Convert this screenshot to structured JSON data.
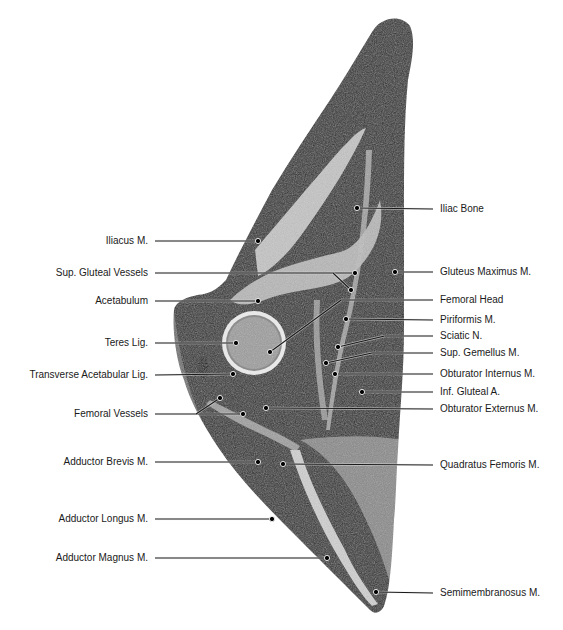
{
  "figure": {
    "background_color": "#ffffff",
    "tissue_dark": "#2e2e2e",
    "tissue_light": "#d8d8d8",
    "label_color": "#1a1a1a"
  },
  "labels_left": [
    {
      "text": "Iliacus M.",
      "y": 241,
      "line_x1": 155,
      "dots": [
        [
          258,
          241
        ]
      ]
    },
    {
      "text": "Sup. Gluteal Vessels",
      "y": 273,
      "line_x1": 155,
      "dots": [
        [
          355,
          273
        ],
        [
          351,
          290
        ]
      ]
    },
    {
      "text": "Acetabulum",
      "y": 301,
      "line_x1": 155,
      "dots": [
        [
          258,
          301
        ]
      ]
    },
    {
      "text": "Teres Lig.",
      "y": 343,
      "line_x1": 155,
      "dots": [
        [
          236,
          343
        ]
      ]
    },
    {
      "text": "Transverse Acetabular Lig.",
      "y": 375,
      "line_x1": 155,
      "dots": [
        [
          233,
          374
        ]
      ]
    },
    {
      "text": "Femoral Vessels",
      "y": 414,
      "line_x1": 155,
      "dots": [
        [
          220,
          398
        ],
        [
          243,
          414
        ]
      ]
    },
    {
      "text": "Adductor Brevis M.",
      "y": 462,
      "line_x1": 155,
      "dots": [
        [
          258,
          462
        ]
      ]
    },
    {
      "text": "Adductor Longus M.",
      "y": 519,
      "line_x1": 155,
      "dots": [
        [
          272,
          519
        ]
      ]
    },
    {
      "text": "Adductor Magnus M.",
      "y": 558,
      "line_x1": 155,
      "dots": [
        [
          327,
          558
        ]
      ]
    }
  ],
  "labels_right": [
    {
      "text": "Iliac Bone",
      "y": 209,
      "line_x2": 433,
      "dots": [
        [
          357,
          208
        ]
      ]
    },
    {
      "text": "Gluteus Maximus M.",
      "y": 272,
      "line_x2": 433,
      "dots": [
        [
          395,
          272
        ]
      ]
    },
    {
      "text": "Femoral Head",
      "y": 300,
      "line_x2": 433,
      "dots": [
        [
          270,
          352
        ]
      ]
    },
    {
      "text": "Piriformis M.",
      "y": 320,
      "line_x2": 433,
      "dots": [
        [
          346,
          319
        ]
      ]
    },
    {
      "text": "Sciatic N.",
      "y": 336,
      "line_x2": 433,
      "dots": [
        [
          338,
          347
        ]
      ]
    },
    {
      "text": "Sup. Gemellus M.",
      "y": 353,
      "line_x2": 433,
      "dots": [
        [
          326,
          363
        ]
      ]
    },
    {
      "text": "Obturator Internus M.",
      "y": 374,
      "line_x2": 433,
      "dots": [
        [
          335,
          374
        ]
      ]
    },
    {
      "text": "Inf. Gluteal A.",
      "y": 392,
      "line_x2": 433,
      "dots": [
        [
          362,
          392
        ]
      ]
    },
    {
      "text": "Obturator Externus M.",
      "y": 409,
      "line_x2": 433,
      "dots": [
        [
          266,
          408
        ]
      ]
    },
    {
      "text": "Quadratus Femoris M.",
      "y": 465,
      "line_x2": 433,
      "dots": [
        [
          283,
          464
        ]
      ]
    },
    {
      "text": "Semimembranosus M.",
      "y": 593,
      "line_x2": 433,
      "dots": [
        [
          376,
          592
        ]
      ]
    }
  ]
}
